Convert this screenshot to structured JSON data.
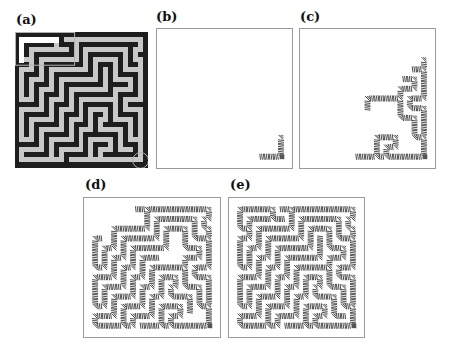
{
  "figure": {
    "panels": [
      {
        "id": "a",
        "label": "(a)",
        "kind": "maze"
      },
      {
        "id": "b",
        "label": "(b)",
        "kind": "partial-fill",
        "coverage": 0.05
      },
      {
        "id": "c",
        "label": "(c)",
        "kind": "partial-fill",
        "coverage": 0.3
      },
      {
        "id": "d",
        "label": "(d)",
        "kind": "partial-fill",
        "coverage": 0.85
      },
      {
        "id": "e",
        "label": "(e)",
        "kind": "full-fill",
        "coverage": 1.0
      }
    ],
    "colors": {
      "wall": "#1e1e1e",
      "path": "#c8c8c8",
      "highlight_box": "#b0b0b0",
      "hatch": "#3a3a3a",
      "frame": "#9a9a9a"
    }
  },
  "maze": {
    "size": 27,
    "rows": [
      "111111111111111111111111111",
      "100000000100000000000000001",
      "101111110111011111111111101",
      "101000000001010000000001001",
      "101011111111010111111101011",
      "100010000000010100000101001",
      "111010111111110101110101101",
      "100010100000000101010100001",
      "101110101111111101010111101",
      "101000101000000001010000101",
      "101011101011111111011110101",
      "101010001010000000010000101",
      "101010111010111111110111101",
      "100010100010100000000100001",
      "111110101110101111110101111",
      "100000101000101000010100001",
      "101111101011101011010111101",
      "101000001010001010010000101",
      "101011111010111010111110101",
      "101010000010100010000010101",
      "101010111110101111111010101",
      "100010100000101000001010001",
      "111110101111101011101011101",
      "100000101000001010001000101",
      "101111101011111010111111101",
      "100000000010000000000000001",
      "111111111111111111111111111"
    ]
  }
}
